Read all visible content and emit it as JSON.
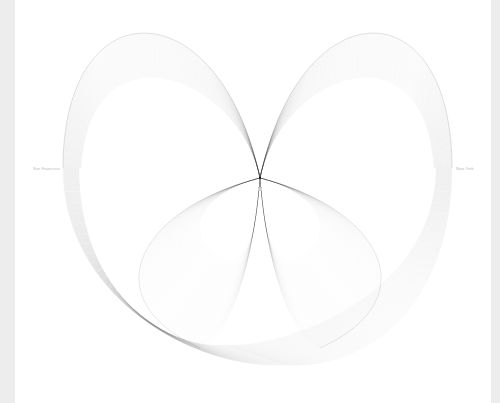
{
  "chart_data": {
    "type": "line",
    "title": "",
    "labels": {
      "left": "San Francisco",
      "right": "New York",
      "bottom": ""
    },
    "geometry": {
      "center": [
        260,
        178
      ],
      "outer_extent": {
        "left": 63,
        "right": 452,
        "top": 25,
        "bottom": 365
      },
      "upper_left_lobe_peak": [
        140,
        25
      ],
      "upper_right_lobe_peak": [
        380,
        25
      ],
      "lower_left_lobe_tip": [
        130,
        290
      ],
      "lower_right_lobe_tip": [
        400,
        290
      ]
    },
    "style": {
      "stroke": "#000000",
      "stroke_opacity": 0.05,
      "background": "#ffffff",
      "edge_strip": "#ededed",
      "label_color": "#b8b8b8"
    },
    "grid": false,
    "legend": null
  }
}
